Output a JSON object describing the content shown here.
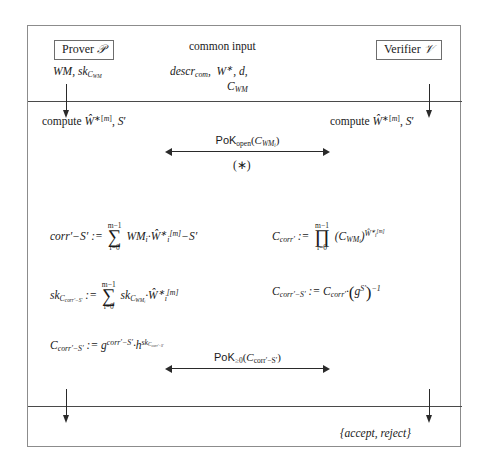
{
  "figure": {
    "type": "cryptographic-protocol-diagram",
    "prover": {
      "box_label": "Prover ℘",
      "box_label_plain": "Prover P",
      "secret_input": "WM, sk_CWM"
    },
    "verifier": {
      "box_label": "Verifier 𝒱",
      "box_label_plain": "Verifier V"
    },
    "common_input": {
      "title": "common input",
      "line1": "descr_com, W*, d,",
      "line2": "C_WM"
    },
    "compute_step": {
      "left": "compute Ŵ*^[m], S′",
      "right": "compute Ŵ*^[m], S′"
    },
    "messages": [
      {
        "name": "pok-open",
        "label": "PoK_open(C_WM_i)",
        "note": "(*)",
        "direction": "bidirectional"
      },
      {
        "name": "pok-range",
        "label": "PoK_≥0(C_corr′−S′)",
        "direction": "bidirectional"
      }
    ],
    "prover_formulas": [
      "corr′ − S′ := Σ_{i=0}^{m−1} WM_i · Ŵ*_i^[m] − S′",
      "sk_C_corr′−S′ := Σ_{i=0}^{m−1} sk_C_WM_i · Ŵ*_i^[m]",
      "C_corr′−S′ := g^{corr′−S′} · h^{sk_C_corr′−S′}"
    ],
    "verifier_formulas": [
      "C_corr′ := Π_{i=0}^{m−1} (C_WM_i)^{Ŵ*_i^[m]}",
      "C_corr′−S′ := C_corr′ · (g^{S′})^{−1}"
    ],
    "verdict": "{accept, reject}",
    "colors": {
      "frame": "#8c8c8c",
      "rule": "#4a4a4a",
      "arrow": "#2a2a2a",
      "text": "#1a1a1a",
      "background": "#ffffff"
    }
  }
}
